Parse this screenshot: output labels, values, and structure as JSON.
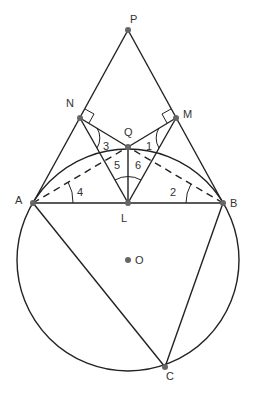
{
  "diagram": {
    "type": "geometry",
    "colors": {
      "line": "#222222",
      "point": "#666666",
      "text": "#333333"
    },
    "circle": {
      "center": "O",
      "cx": 128,
      "cy": 260,
      "r": 111
    },
    "points": {
      "P": {
        "x": 128,
        "y": 30,
        "label": "P"
      },
      "N": {
        "x": 80,
        "y": 118,
        "label": "N"
      },
      "M": {
        "x": 176,
        "y": 118,
        "label": "M"
      },
      "Q": {
        "x": 128,
        "y": 147,
        "label": "Q"
      },
      "A": {
        "x": 33,
        "y": 203,
        "label": "A"
      },
      "B": {
        "x": 223,
        "y": 203,
        "label": "B"
      },
      "L": {
        "x": 128,
        "y": 203,
        "label": "L"
      },
      "O": {
        "x": 128,
        "y": 260,
        "label": "O"
      },
      "C": {
        "x": 165,
        "y": 367,
        "label": "C"
      }
    },
    "segments_solid": [
      "PA",
      "PB",
      "NQ",
      "MQ",
      "NL",
      "ML",
      "QL",
      "AB",
      "AC",
      "BC"
    ],
    "segments_dashed": [
      "AQ",
      "BQ"
    ],
    "right_angles": [
      "N",
      "M"
    ],
    "angle_labels": {
      "a1": "1",
      "a2": "2",
      "a3": "3",
      "a4": "4",
      "a5": "5",
      "a6": "6"
    }
  }
}
